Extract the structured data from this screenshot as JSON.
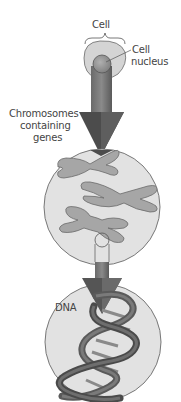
{
  "figure": {
    "labels": {
      "cell": "Cell",
      "cell_nucleus_line1": "Cell",
      "cell_nucleus_line2": "nucleus",
      "chromosomes_line1": "Chromosomes",
      "chromosomes_line2": "containing",
      "chromosomes_line3": "genes",
      "dna": "DNA"
    },
    "stages": [
      {
        "id": "cell",
        "shape": "cell-with-nucleus"
      },
      {
        "id": "chromosomes",
        "shape": "circle-with-3-chromosomes"
      },
      {
        "id": "dna",
        "shape": "circle-with-double-helix"
      }
    ],
    "colors": {
      "circle_fill": "#e2e2e2",
      "circle_stroke": "#6a6a6a",
      "arrow_dark": "#4a4a4a",
      "arrow_light": "#9a9a9a",
      "chromosome_fill": "#a6a6a6",
      "helix_dark": "#555555",
      "text": "#444444"
    }
  }
}
